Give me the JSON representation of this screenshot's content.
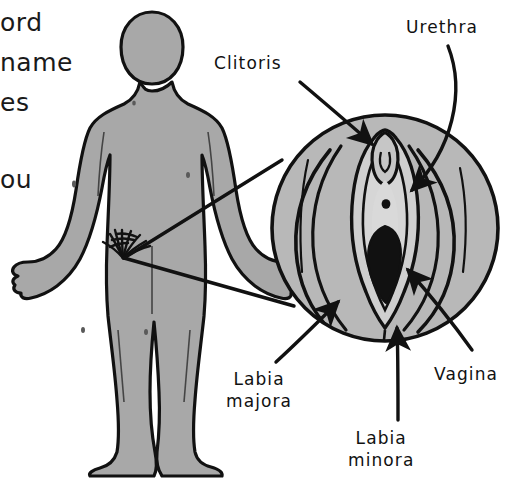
{
  "page": {
    "background_color": "#ffffff"
  },
  "colors": {
    "ink": "#111111",
    "body_fill": "#a8a8a8",
    "vulva_fill": "#b8b8b8",
    "vestibule_fill": "#cfcfcf",
    "opening_fill": "#111111",
    "text": "#1a1a1a"
  },
  "body_copy": {
    "note": "Text clipped by the left edge of the screenshot",
    "fragments": [
      {
        "text": "ord",
        "x": 0,
        "y": 8
      },
      {
        "text": "name",
        "x": 0,
        "y": 48
      },
      {
        "text": "es",
        "x": 0,
        "y": 88
      },
      {
        "text": "ou",
        "x": 0,
        "y": 165
      }
    ]
  },
  "figure": {
    "person": {
      "name": "standing human body silhouette",
      "fill": "#a8a8a8",
      "outline": "#111111",
      "pubic_hair": "present"
    },
    "magnifier": {
      "name": "vulva close-up circle",
      "center_x": 385,
      "center_y": 228,
      "radius": 114,
      "origin_x": 123,
      "origin_y": 258
    }
  },
  "labels": [
    {
      "id": "clitoris",
      "lines": [
        "Clitoris"
      ],
      "x": 214,
      "y": 52,
      "arrow_from": [
        300,
        82
      ],
      "arrow_to": [
        375,
        146
      ]
    },
    {
      "id": "urethra",
      "lines": [
        "Urethra"
      ],
      "x": 406,
      "y": 16,
      "arrow_from": [
        446,
        48
      ],
      "arrow_to": [
        406,
        196
      ]
    },
    {
      "id": "vagina",
      "lines": [
        "Vagina"
      ],
      "x": 434,
      "y": 363,
      "arrow_from": [
        470,
        352
      ],
      "arrow_to": [
        404,
        266
      ]
    },
    {
      "id": "labia-majora",
      "lines": [
        "Labia",
        "majora"
      ],
      "x": 226,
      "y": 368,
      "arrow_from": [
        276,
        362
      ],
      "arrow_to": [
        341,
        299
      ]
    },
    {
      "id": "labia-minora",
      "lines": [
        "Labia",
        "minora"
      ],
      "x": 348,
      "y": 427,
      "arrow_from": [
        398,
        420
      ],
      "arrow_to": [
        397,
        324
      ]
    }
  ]
}
